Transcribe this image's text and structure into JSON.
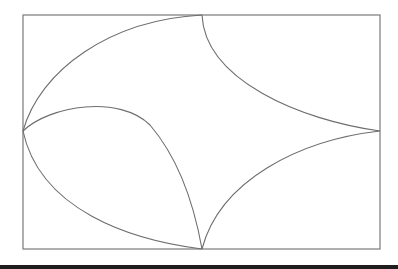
{
  "figure": {
    "description": "Curvilinear quadrilateral inscribed in a rectangle with curved arcs connecting midpoints of the rectangle's sides",
    "colors": {
      "stroke": "#6e6e6e",
      "frame": "#7a7a7a",
      "background": "#ffffff",
      "bottom_bar": "#1e1e1e"
    },
    "frame": {
      "x": 23,
      "y": 15,
      "width": 357,
      "height": 234
    },
    "vertices": {
      "top": [
        202,
        15
      ],
      "right": [
        380,
        131
      ],
      "bottom": [
        202,
        249
      ],
      "left": [
        23,
        131
      ]
    },
    "curves": [
      {
        "name": "outer-top-left-arc",
        "path": "M23,131 C40,70 110,20 202,15"
      },
      {
        "name": "top-right-arc",
        "path": "M202,15 C205,80 300,120 380,131"
      },
      {
        "name": "right-bottom-arc",
        "path": "M380,131 C300,140 220,180 202,249"
      },
      {
        "name": "outer-bottom-left-arc",
        "path": "M23,131 C40,210 130,240 202,249"
      },
      {
        "name": "inner-lobe-arc",
        "path": "M23,131 C50,105 120,95 150,125 C180,160 195,210 202,249"
      }
    ]
  }
}
